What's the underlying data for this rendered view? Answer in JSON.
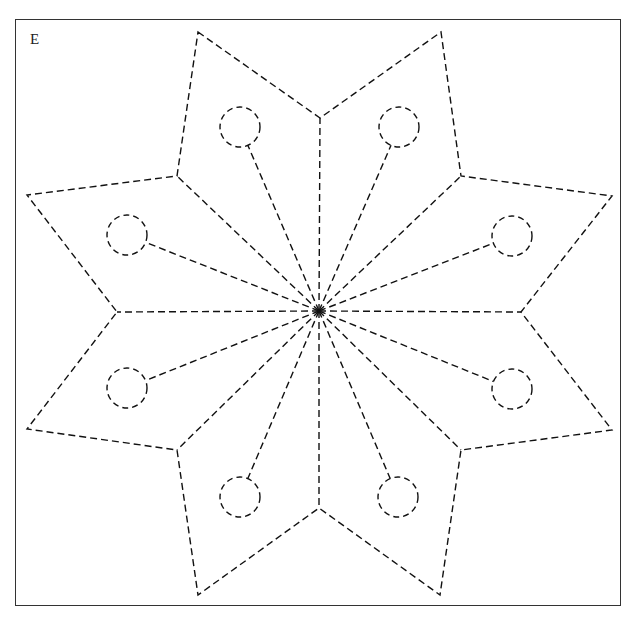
{
  "figure": {
    "label": "E",
    "stroke_color": "#111111",
    "frame_color": "#333333",
    "background": "#ffffff"
  },
  "star": {
    "center": [
      319,
      311
    ],
    "outline": [
      [
        198,
        32
      ],
      [
        320,
        118
      ],
      [
        441,
        32
      ],
      [
        461,
        176
      ],
      [
        612,
        196
      ],
      [
        521,
        312
      ],
      [
        612,
        430
      ],
      [
        461,
        450
      ],
      [
        440,
        595
      ],
      [
        319,
        508
      ],
      [
        198,
        595
      ],
      [
        177,
        450
      ],
      [
        27,
        429
      ],
      [
        117,
        312
      ],
      [
        27,
        195
      ],
      [
        177,
        176
      ]
    ],
    "spokes_to": [
      [
        320,
        118
      ],
      [
        461,
        176
      ],
      [
        521,
        312
      ],
      [
        461,
        450
      ],
      [
        319,
        508
      ],
      [
        177,
        450
      ],
      [
        117,
        312
      ],
      [
        177,
        176
      ]
    ],
    "circles": [
      {
        "cx": 240,
        "cy": 127,
        "r": 20
      },
      {
        "cx": 399,
        "cy": 127,
        "r": 20
      },
      {
        "cx": 512,
        "cy": 236,
        "r": 20
      },
      {
        "cx": 512,
        "cy": 389,
        "r": 20
      },
      {
        "cx": 398,
        "cy": 497,
        "r": 20
      },
      {
        "cx": 240,
        "cy": 497,
        "r": 20
      },
      {
        "cx": 127,
        "cy": 388,
        "r": 20
      },
      {
        "cx": 127,
        "cy": 235,
        "r": 20
      }
    ]
  }
}
